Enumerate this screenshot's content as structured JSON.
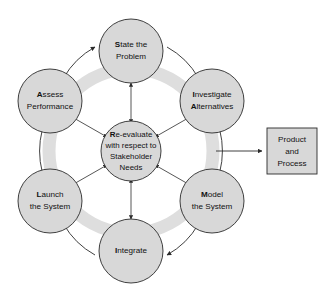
{
  "diagram": {
    "type": "cycle-diagram",
    "colors": {
      "node_fill": "#d8d8d8",
      "node_stroke": "#2b2b2b",
      "ring_band": "#dedede",
      "box_fill": "#d8d8d8",
      "text": "#111111",
      "background": "#ffffff"
    },
    "center": {
      "name": "re-evaluate",
      "lines": [
        {
          "lead": "R",
          "rest": "e-evaluate"
        },
        {
          "lead": "",
          "rest": "with respect to"
        },
        {
          "lead": "",
          "rest": "Stakeholder"
        },
        {
          "lead": "",
          "rest": "Needs"
        }
      ],
      "full_text": "Re-evaluate with respect to Stakeholder Needs"
    },
    "nodes": [
      {
        "id": "state-the-problem",
        "position": "top",
        "lines": [
          {
            "lead": "S",
            "rest": "tate the"
          },
          {
            "lead": "",
            "rest": "Problem"
          }
        ],
        "full_text": "State the Problem"
      },
      {
        "id": "investigate-alternatives",
        "position": "top-right",
        "lines": [
          {
            "lead": "I",
            "rest": "nvestigate"
          },
          {
            "lead": "A",
            "rest": "lternatives"
          }
        ],
        "full_text": "Investigate Alternatives"
      },
      {
        "id": "model-the-system",
        "position": "bottom-right",
        "lines": [
          {
            "lead": "M",
            "rest": "odel"
          },
          {
            "lead": "",
            "rest": "the System"
          }
        ],
        "full_text": "Model the System"
      },
      {
        "id": "integrate",
        "position": "bottom",
        "lines": [
          {
            "lead": "I",
            "rest": "ntegrate"
          }
        ],
        "full_text": "Integrate"
      },
      {
        "id": "launch-the-system",
        "position": "bottom-left",
        "lines": [
          {
            "lead": "L",
            "rest": "aunch"
          },
          {
            "lead": "",
            "rest": "the System"
          }
        ],
        "full_text": "Launch the System"
      },
      {
        "id": "assess-performance",
        "position": "top-left",
        "lines": [
          {
            "lead": "A",
            "rest": "ssess"
          },
          {
            "lead": "",
            "rest": "Performance"
          }
        ],
        "full_text": "Assess Performance"
      }
    ],
    "output_box": {
      "id": "product-and-process",
      "lines": [
        "Product",
        "and",
        "Process"
      ],
      "full_text": "Product and Process"
    },
    "flow": {
      "direction": "clockwise",
      "center_links": "bidirectional",
      "output_link": "from cycle to Product and Process"
    }
  }
}
